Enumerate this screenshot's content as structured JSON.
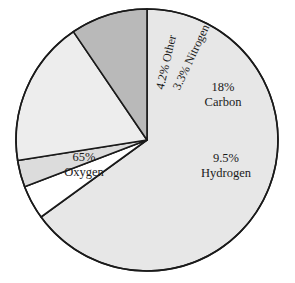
{
  "chart_data": {
    "type": "pie",
    "title": "",
    "subtitle": "",
    "xlabel": "",
    "ylabel": "",
    "legend_position": "none",
    "grid": false,
    "units": "percent",
    "labels_inside_slices": true,
    "categories": [
      "Oxygen",
      "Carbon",
      "Hydrogen",
      "Other",
      "Nitrogen"
    ],
    "values": [
      65,
      18,
      9.5,
      4.2,
      3.3
    ],
    "slices": [
      {
        "name": "Oxygen",
        "value": 65,
        "percent_text": "65%",
        "label_text": "Oxygen",
        "color": "#e7e7e7",
        "start_angle_deg": 0,
        "end_angle_deg": 234,
        "label_orientation": "horizontal"
      },
      {
        "name": "Other",
        "value": 4.2,
        "percent_text": "4.2%",
        "label_text": "Other",
        "color": "#ffffff",
        "start_angle_deg": 234,
        "end_angle_deg": 249.12,
        "label_orientation": "vertical"
      },
      {
        "name": "Nitrogen",
        "value": 3.3,
        "percent_text": "3.3%",
        "label_text": "Nitrogen",
        "color": "#dcdcdc",
        "start_angle_deg": 249.12,
        "end_angle_deg": 260.99,
        "label_orientation": "vertical"
      },
      {
        "name": "Carbon",
        "value": 18,
        "percent_text": "18%",
        "label_text": "Carbon",
        "color": "#ededed",
        "start_angle_deg": 260.99,
        "end_angle_deg": 325.79,
        "label_orientation": "horizontal"
      },
      {
        "name": "Hydrogen",
        "value": 9.5,
        "percent_text": "9.5%",
        "label_text": "Hydrogen",
        "color": "#b9b9b9",
        "start_angle_deg": 325.79,
        "end_angle_deg": 360,
        "label_orientation": "horizontal"
      }
    ],
    "style": {
      "outline_color": "#1a1a1a",
      "outline_width": 1.6,
      "background": "#ffffff",
      "center_x": 147,
      "center_y": 140,
      "radius": 131
    }
  }
}
